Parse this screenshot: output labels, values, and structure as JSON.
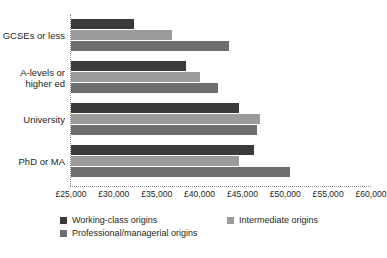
{
  "chart_data": {
    "type": "bar",
    "orientation": "horizontal",
    "title": "",
    "xlabel": "",
    "ylabel": "",
    "categories": [
      "GCSEs or less",
      "A-levels or higher ed",
      "University",
      "PhD or MA"
    ],
    "series": [
      {
        "name": "Working-class origins",
        "color": "#3a3a3a",
        "values": [
          32300,
          38400,
          44600,
          46400
        ]
      },
      {
        "name": "Intermediate origins",
        "color": "#9b9b9b",
        "values": [
          36800,
          40000,
          47000,
          44600
        ]
      },
      {
        "name": "Professional/managerial origins",
        "color": "#6e6e6e",
        "values": [
          43400,
          42200,
          46700,
          50600
        ]
      }
    ],
    "xlim": [
      25000,
      60000
    ],
    "xticks": [
      25000,
      30000,
      35000,
      40000,
      45000,
      50000,
      55000,
      60000
    ],
    "xtick_labels": [
      "£25,000",
      "£30,000",
      "£35,000",
      "£40,000",
      "£45,000",
      "£50,000",
      "£55,000",
      "£60,000"
    ],
    "grid": false,
    "axis_style": "dotted",
    "legend_position": "bottom-left",
    "legend_entries": [
      "Working-class origins",
      "Intermediate origins",
      "Professional/managerial origins"
    ]
  },
  "categories_multiline": [
    [
      "GCSEs or less"
    ],
    [
      "A-levels or",
      "higher ed"
    ],
    [
      "University"
    ],
    [
      "PhD or MA"
    ]
  ]
}
